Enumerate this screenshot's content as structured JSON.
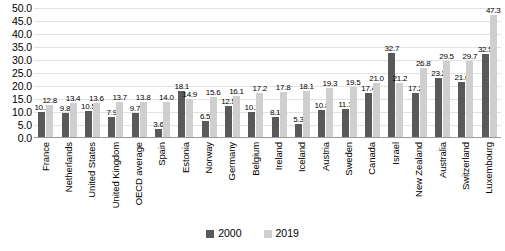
{
  "chart_data": {
    "type": "bar",
    "title": "",
    "xlabel": "",
    "ylabel": "",
    "ylim": [
      0,
      50
    ],
    "ytick_step": 5,
    "grid": true,
    "legend_position": "bottom",
    "yticks": [
      "0.0",
      "5.0",
      "10.0",
      "15.0",
      "20.0",
      "25.0",
      "30.0",
      "35.0",
      "40.0",
      "45.0",
      "50.0"
    ],
    "categories": [
      "France",
      "Netherlands",
      "United States",
      "United Kingdom",
      "OECD average",
      "Spain",
      "Estonia",
      "Norway",
      "Germany",
      "Belgium",
      "Ireland",
      "Iceland",
      "Austria",
      "Sweden",
      "Canada",
      "Israel",
      "New Zealand",
      "Australia",
      "Switzerland",
      "Luxembourg"
    ],
    "series": [
      {
        "name": "2000",
        "color": "#595959",
        "values": [
          10.1,
          9.8,
          10.5,
          7.9,
          9.7,
          3.6,
          18.1,
          6.5,
          12.5,
          10.1,
          8.1,
          5.3,
          10.8,
          11.1,
          17.4,
          32.7,
          17.2,
          23.2,
          21.6,
          32.5
        ],
        "labels": [
          "10.1",
          "9.8",
          "10.5",
          "7.9",
          "9.7",
          "3.6",
          "18.1",
          "6.5",
          "12.5",
          "10.1",
          "8.1",
          "5.3",
          "10.8",
          "11.1",
          "17.4",
          "32.7",
          "17.2",
          "23.2",
          "21.6",
          "32.5"
        ]
      },
      {
        "name": "2019",
        "color": "#cfcfcf",
        "values": [
          12.8,
          13.4,
          13.6,
          13.7,
          13.8,
          14.0,
          14.9,
          15.6,
          16.1,
          17.2,
          17.8,
          18.1,
          19.3,
          19.5,
          21.0,
          21.2,
          26.8,
          29.5,
          29.7,
          47.3
        ],
        "labels": [
          "12.8",
          "13.4",
          "13.6",
          "13.7",
          "13.8",
          "14.0",
          "14.9",
          "15.6",
          "16.1",
          "17.2",
          "17.8",
          "18.1",
          "19.3",
          "19.5",
          "21.0",
          "21.2",
          "26.8",
          "29.5",
          "29.7",
          "47.3"
        ]
      }
    ]
  }
}
